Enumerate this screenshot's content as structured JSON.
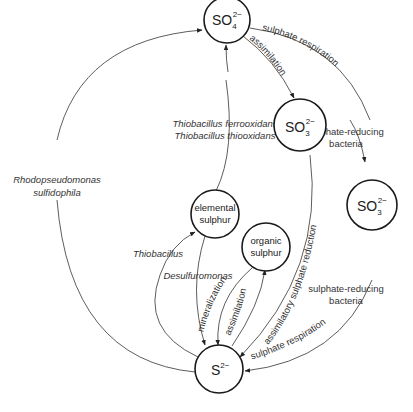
{
  "diagram": {
    "nodes": {
      "sulfate": {
        "base": "SO",
        "sub": "4",
        "sup": "2−"
      },
      "sulfite_a": {
        "base": "SO",
        "sub": "3",
        "sup": "2−"
      },
      "sulfite_b": {
        "base": "SO",
        "sub": "3",
        "sup": "2−"
      },
      "elemental": {
        "line1": "elemental",
        "line2": "sulphur"
      },
      "organic": {
        "line1": "organic",
        "line2": "sulphur"
      },
      "sulfide": {
        "base": "S",
        "sup": "2−"
      }
    },
    "edges": {
      "sulphate_respiration_top": "sulphate respiration",
      "assimilation_top": "assimilation",
      "thiobacillus_ferro": "Thiobacillus ferrooxidans",
      "thiobacillus_thio": "Thiobacillus thiooxidans",
      "rhodo_1": "Rhodopseudomonas",
      "rhodo_2": "sulfidophila",
      "srb_top_1": "sulphate-reducing",
      "srb_top_2": "bacteria",
      "thiobacillus": "Thiobacillus",
      "desulfuromonas": "Desulfuromonas",
      "mineralization": "mineralization",
      "assimilation_bottom": "assimilation",
      "assimilatory_reduction": "assimilatory sulphate reduction",
      "srb_bottom_1": "sulphate-reducing",
      "srb_bottom_2": "bacteria",
      "sulphate_respiration_bottom": "sulphate respiration"
    }
  }
}
